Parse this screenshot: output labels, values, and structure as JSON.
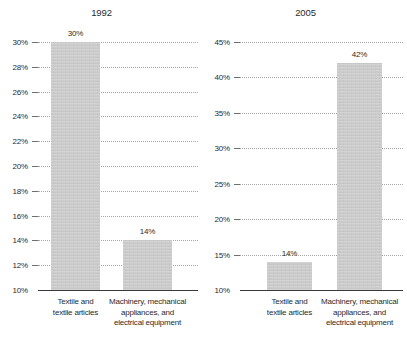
{
  "chart_data": [
    {
      "type": "bar",
      "title": "1992",
      "xlabel": "",
      "ylabel": "",
      "categories": [
        "Textile and textile articles",
        "Machinery, mechanical appliances, and electrical equipment"
      ],
      "category_lines": [
        [
          "Textile and",
          "textile articles"
        ],
        [
          "Machinery, mechanical",
          "appliances, and",
          "electrical equipment"
        ]
      ],
      "values": [
        30,
        14
      ],
      "value_labels": [
        "30%",
        "14%"
      ],
      "ylim": [
        10,
        30
      ],
      "ytick_values": [
        30,
        28,
        26,
        24,
        22,
        20,
        18,
        16,
        14,
        12,
        10
      ],
      "ytick_labels": [
        "30%",
        "28%",
        "26%",
        "24%",
        "22%",
        "20%",
        "18%",
        "16%",
        "14%",
        "12%",
        "10%"
      ],
      "grid": true,
      "legend": "none",
      "bar_color": "#c9c9c9",
      "axis_color": "#3a3a3a",
      "grid_color": "#9a9a9a"
    },
    {
      "type": "bar",
      "title": "2005",
      "xlabel": "",
      "ylabel": "",
      "categories": [
        "Textile and textile articles",
        "Machinery, mechanical appliances, and electrical equipment"
      ],
      "category_lines": [
        [
          "Textile and",
          "textile articles"
        ],
        [
          "Machinery, mechanical",
          "appliances, and",
          "electrical equipment"
        ]
      ],
      "values": [
        14,
        42
      ],
      "value_labels": [
        "14%",
        "42%"
      ],
      "ylim": [
        10,
        45
      ],
      "ytick_values": [
        45,
        40,
        35,
        30,
        25,
        20,
        15,
        10
      ],
      "ytick_labels": [
        "45%",
        "40%",
        "35%",
        "30%",
        "25%",
        "20%",
        "15%",
        "10%"
      ],
      "grid": true,
      "legend": "none",
      "bar_color": "#c9c9c9",
      "axis_color": "#3a3a3a",
      "grid_color": "#9a9a9a"
    }
  ]
}
